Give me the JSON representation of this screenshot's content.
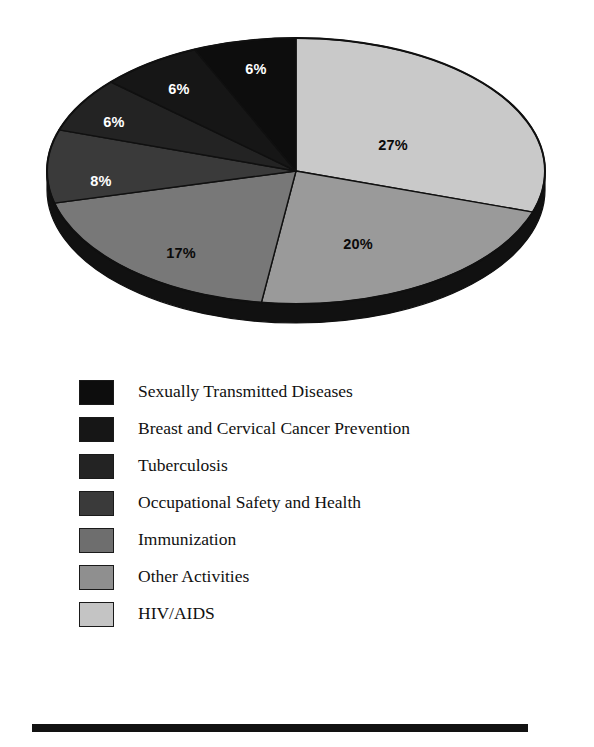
{
  "chart_data": {
    "type": "pie",
    "title": "",
    "subtitle": "",
    "xlabel": "",
    "ylabel": "",
    "grid": false,
    "legend_position": "below",
    "three_d": true,
    "start_angle_deg": 0,
    "direction": "clockwise",
    "categories": [
      "HIV/AIDS",
      "Other Activities",
      "Immunization",
      "Occupational Safety and Health",
      "Tuberculosis",
      "Breast and Cervical Cancer Prevention",
      "Sexually Transmitted Diseases"
    ],
    "values": [
      27,
      20,
      17,
      8,
      6,
      6,
      6
    ],
    "value_labels": [
      "27%",
      "20%",
      "17%",
      "8%",
      "6%",
      "6%",
      "6%"
    ],
    "units": "percent",
    "total": 90,
    "slices": [
      {
        "label": "HIV/AIDS",
        "value": 27,
        "value_label": "27%",
        "color": "#c9c9c9",
        "label_color": "#0a0a0a",
        "label_x": 393,
        "label_y": 145
      },
      {
        "label": "Other Activities",
        "value": 20,
        "value_label": "20%",
        "color": "#9a9a9a",
        "label_color": "#0a0a0a",
        "label_x": 358,
        "label_y": 244
      },
      {
        "label": "Immunization",
        "value": 17,
        "value_label": "17%",
        "color": "#787878",
        "label_color": "#0a0a0a",
        "label_x": 181,
        "label_y": 253
      },
      {
        "label": "Occupational Safety and Health",
        "value": 8,
        "value_label": "8%",
        "color": "#3a3a3a",
        "label_color": "#ffffff",
        "label_x": 101,
        "label_y": 181
      },
      {
        "label": "Tuberculosis",
        "value": 6,
        "value_label": "6%",
        "color": "#232323",
        "label_color": "#ffffff",
        "label_x": 114,
        "label_y": 122
      },
      {
        "label": "Breast and Cervical Cancer Prevention",
        "value": 6,
        "value_label": "6%",
        "color": "#161616",
        "label_color": "#ffffff",
        "label_x": 179,
        "label_y": 89
      },
      {
        "label": "Sexually Transmitted Diseases",
        "value": 6,
        "value_label": "6%",
        "color": "#0d0d0d",
        "label_color": "#ffffff",
        "label_x": 256,
        "label_y": 69
      }
    ]
  },
  "legend": {
    "items": [
      {
        "label": "Sexually Transmitted Diseases",
        "color": "#0d0d0d"
      },
      {
        "label": "Breast and Cervical Cancer Prevention",
        "color": "#161616"
      },
      {
        "label": "Tuberculosis",
        "color": "#232323"
      },
      {
        "label": "Occupational Safety and Health",
        "color": "#3a3a3a"
      },
      {
        "label": "Immunization",
        "color": "#6e6e6e"
      },
      {
        "label": "Other Activities",
        "color": "#8f8f8f"
      },
      {
        "label": "HIV/AIDS",
        "color": "#c4c4c4"
      }
    ]
  },
  "colors": {
    "background": "#ffffff",
    "outline": "#101010",
    "rule": "#121212"
  }
}
